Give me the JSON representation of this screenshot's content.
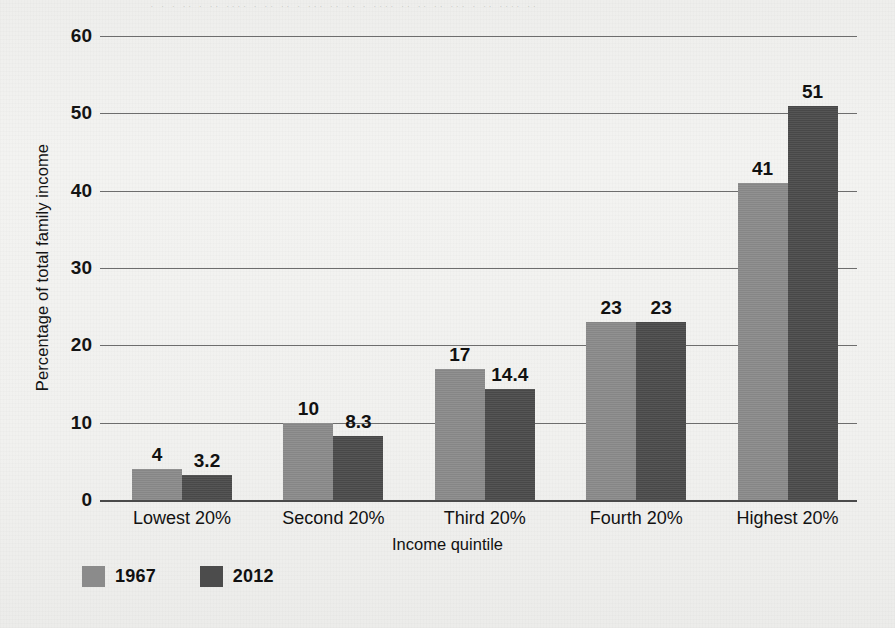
{
  "chart_data": {
    "type": "bar",
    "title": "",
    "subtitle": "",
    "xlabel": "Income quintile",
    "ylabel": "Percentage of total family income",
    "categories": [
      "Lowest 20%",
      "Second 20%",
      "Third 20%",
      "Fourth 20%",
      "Highest 20%"
    ],
    "series": [
      {
        "name": "1967",
        "color": "#8b8b8b",
        "values": [
          4,
          10,
          17,
          23,
          41
        ],
        "value_labels": [
          "4",
          "10",
          "17",
          "23",
          "41"
        ]
      },
      {
        "name": "2012",
        "color": "#4c4c4c",
        "values": [
          3.2,
          8.3,
          14.4,
          23,
          51
        ],
        "value_labels": [
          "3.2",
          "8.3",
          "14.4",
          "23",
          "51"
        ]
      }
    ],
    "ylim": [
      0,
      60
    ],
    "yticks": [
      0,
      10,
      20,
      30,
      40,
      50,
      60
    ],
    "ytick_labels": [
      "0",
      "10",
      "20",
      "30",
      "40",
      "50",
      "60"
    ],
    "grid": true,
    "grid_axis": "y",
    "legend_position": "bottom-left",
    "bar_value_labels": true
  },
  "axes": {
    "y_title": "Percentage of total family income",
    "x_title": "Income quintile"
  },
  "legend": {
    "items": [
      {
        "label": "1967",
        "swatch": "legend-swatch-1967"
      },
      {
        "label": "2012",
        "swatch": "legend-swatch-2012"
      }
    ]
  },
  "artifacts": {
    "bleed_through_text": "· · ·  ·· · ·· ···· · ·· ·· · ··· ·· ·· · ···· ·· ·· ·· ··· · ·· ···· ··"
  }
}
